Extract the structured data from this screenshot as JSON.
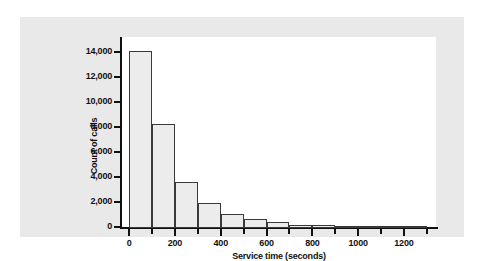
{
  "chart_data": {
    "type": "bar",
    "title": "",
    "xlabel": "Service time (seconds)",
    "ylabel": "Count of calls",
    "grid": false,
    "legend": false,
    "xlim": [
      -40,
      1340
    ],
    "ylim": [
      0,
      15200
    ],
    "bin_width": 100,
    "x_ticks": [
      0,
      200,
      400,
      600,
      800,
      1000,
      1200
    ],
    "x_tick_labels": [
      "0",
      "200",
      "400",
      "600",
      "800",
      "1000",
      "1200"
    ],
    "x_minor_ticks": [
      100,
      300,
      500,
      700,
      900,
      1100,
      1300
    ],
    "y_ticks": [
      0,
      2000,
      4000,
      6000,
      8000,
      10000,
      12000,
      14000
    ],
    "y_tick_labels": [
      "0",
      "2,000",
      "4,000",
      "6,000",
      "8,000",
      "10,000",
      "12,000",
      "14,000"
    ],
    "bins": [
      {
        "x0": 0,
        "x1": 100,
        "value": 14200
      },
      {
        "x0": 100,
        "x1": 200,
        "value": 8300
      },
      {
        "x0": 200,
        "x1": 300,
        "value": 3650
      },
      {
        "x0": 300,
        "x1": 400,
        "value": 2000
      },
      {
        "x0": 400,
        "x1": 500,
        "value": 1100
      },
      {
        "x0": 500,
        "x1": 600,
        "value": 700
      },
      {
        "x0": 600,
        "x1": 700,
        "value": 480
      },
      {
        "x0": 700,
        "x1": 800,
        "value": 280
      },
      {
        "x0": 800,
        "x1": 900,
        "value": 210
      },
      {
        "x0": 900,
        "x1": 1000,
        "value": 140
      },
      {
        "x0": 1000,
        "x1": 1100,
        "value": 110
      },
      {
        "x0": 1100,
        "x1": 1200,
        "value": 60
      },
      {
        "x0": 1200,
        "x1": 1300,
        "value": 40
      }
    ],
    "categories": [
      "0-100",
      "100-200",
      "200-300",
      "300-400",
      "400-500",
      "500-600",
      "600-700",
      "700-800",
      "800-900",
      "900-1000",
      "1000-1100",
      "1100-1200",
      "1200-1300"
    ],
    "values": [
      14200,
      8300,
      3650,
      2000,
      1100,
      700,
      480,
      280,
      210,
      140,
      110,
      60,
      40
    ],
    "colors": {
      "bar_fill": "#ececed",
      "bar_edge": "#3a3a3a",
      "axis": "#111111",
      "panel_background": "#e9e9e9",
      "plot_background": "#ffffff",
      "text": "#111111"
    }
  }
}
